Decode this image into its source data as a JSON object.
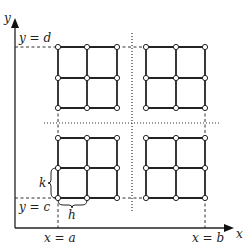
{
  "diagram": {
    "axes": {
      "x_label": "x",
      "y_label": "y"
    },
    "boundaries": {
      "y_top": "y = d",
      "y_bottom": "y = c",
      "x_left": "x = a",
      "x_right": "x = b"
    },
    "step_labels": {
      "vertical_step": "k",
      "horizontal_step": "h"
    },
    "grids": [
      {
        "name": "top-left",
        "cols": [
          58,
          87,
          117
        ],
        "rows": [
          47,
          78,
          108
        ]
      },
      {
        "name": "top-right",
        "cols": [
          146,
          176,
          205
        ],
        "rows": [
          47,
          78,
          108
        ]
      },
      {
        "name": "bottom-left",
        "cols": [
          58,
          87,
          117
        ],
        "rows": [
          138,
          168,
          198
        ]
      },
      {
        "name": "bottom-right",
        "cols": [
          146,
          176,
          205
        ],
        "rows": [
          138,
          168,
          198
        ]
      }
    ],
    "colors": {
      "line": "#222222",
      "node_fill": "#ffffff"
    }
  }
}
